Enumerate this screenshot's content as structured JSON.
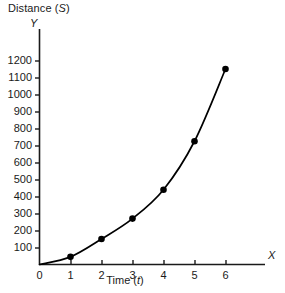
{
  "figure": {
    "title_prefix": "Distance (",
    "title_symbol": "S",
    "title_suffix": ")",
    "y_axis_name": "Y",
    "x_axis_name": "X",
    "x_caption_prefix": "Time (",
    "x_caption_symbol": "t",
    "x_caption_suffix": ")",
    "line_color": "#000000",
    "marker_color": "#000000",
    "axis_color": "#1a1a1a",
    "background_color": "#ffffff"
  },
  "chart_data": {
    "type": "line",
    "title": "Distance (S)",
    "xlabel": "Time (t)",
    "ylabel": "Distance (S)",
    "x_axis_symbol": "X",
    "y_axis_symbol": "Y",
    "x": [
      1,
      2,
      3,
      4,
      5,
      6
    ],
    "values": [
      45,
      150,
      270,
      440,
      725,
      1150
    ],
    "series": [
      {
        "name": "Distance",
        "values": [
          45,
          150,
          270,
          440,
          725,
          1150
        ]
      }
    ],
    "xlim": [
      0,
      7.9
    ],
    "ylim": [
      0,
      1250
    ],
    "xticks": [
      0,
      1,
      2,
      3,
      4,
      5,
      6
    ],
    "xtick_labels": [
      "0",
      "1",
      "2",
      "3",
      "4",
      "5",
      "6"
    ],
    "yticks": [
      100,
      200,
      300,
      400,
      500,
      600,
      700,
      800,
      900,
      1000,
      1100,
      1200
    ],
    "ytick_labels": [
      "100",
      "200",
      "300",
      "400",
      "500",
      "600",
      "700",
      "800",
      "900",
      "1000",
      "1100",
      "1200"
    ],
    "grid": false,
    "legend": "none",
    "markers": "filled-circle"
  }
}
